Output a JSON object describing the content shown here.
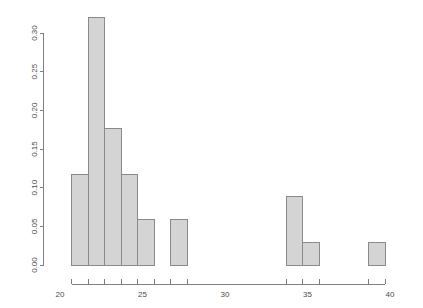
{
  "chart_data": {
    "type": "bar",
    "subtype": "histogram",
    "title": "",
    "subtitle": "",
    "xlabel": "",
    "ylabel": "",
    "xlim": [
      20.0,
      40.0
    ],
    "ylim": [
      0.0,
      0.32
    ],
    "grid": false,
    "legend": null,
    "bin_width": 1.0,
    "bins": [
      {
        "x0": 20.7,
        "x1": 21.7,
        "density": 0.117
      },
      {
        "x0": 21.7,
        "x1": 22.7,
        "density": 0.32
      },
      {
        "x0": 22.7,
        "x1": 23.7,
        "density": 0.177
      },
      {
        "x0": 23.7,
        "x1": 24.7,
        "density": 0.117
      },
      {
        "x0": 24.7,
        "x1": 25.7,
        "density": 0.059
      },
      {
        "x0": 25.7,
        "x1": 26.7,
        "density": 0.0
      },
      {
        "x0": 26.7,
        "x1": 27.7,
        "density": 0.059
      },
      {
        "x0": 27.7,
        "x1": 28.7,
        "density": 0.0
      },
      {
        "x0": 28.7,
        "x1": 29.7,
        "density": 0.0
      },
      {
        "x0": 29.7,
        "x1": 30.7,
        "density": 0.0
      },
      {
        "x0": 30.7,
        "x1": 31.7,
        "density": 0.0
      },
      {
        "x0": 31.7,
        "x1": 32.7,
        "density": 0.0
      },
      {
        "x0": 32.7,
        "x1": 33.7,
        "density": 0.0
      },
      {
        "x0": 33.7,
        "x1": 34.7,
        "density": 0.088
      },
      {
        "x0": 34.7,
        "x1": 35.7,
        "density": 0.029
      },
      {
        "x0": 35.7,
        "x1": 36.7,
        "density": 0.0
      },
      {
        "x0": 36.7,
        "x1": 37.7,
        "density": 0.0
      },
      {
        "x0": 37.7,
        "x1": 38.7,
        "density": 0.0
      },
      {
        "x0": 38.7,
        "x1": 39.7,
        "density": 0.029
      }
    ],
    "x_axis": {
      "labels": [
        "20",
        "25",
        "30",
        "35",
        "40"
      ],
      "label_values": [
        20,
        25,
        30,
        35,
        40
      ],
      "tick_values": [
        20.7,
        21.7,
        22.7,
        23.7,
        24.7,
        25.7,
        26.7,
        27.7,
        33.7,
        34.7,
        35.7,
        38.7,
        39.7
      ],
      "axis_start": 20.7,
      "axis_end": 39.7
    },
    "y_axis": {
      "labels": [
        "0.00",
        "0.05",
        "0.10",
        "0.15",
        "0.20",
        "0.25",
        "0.30"
      ],
      "label_values": [
        0.0,
        0.05,
        0.1,
        0.15,
        0.2,
        0.25,
        0.3
      ],
      "tick_values": [
        0.0,
        0.05,
        0.1,
        0.15,
        0.2,
        0.25,
        0.3
      ],
      "rotated_labels": true
    },
    "style": {
      "bar_fill": "#d4d4d4",
      "bar_stroke": "#8a8a8a",
      "axis_color": "#808080",
      "text_color": "#4d4d4d",
      "background": "#ffffff"
    }
  }
}
